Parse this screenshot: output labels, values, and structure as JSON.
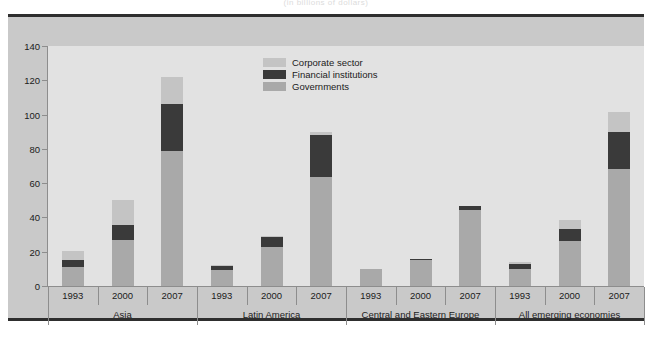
{
  "subtitle": "(in billions of dollars)",
  "legend": {
    "position": "top-center",
    "items": [
      {
        "key": "corp",
        "label": "Corporate sector",
        "color": "#c4c4c4"
      },
      {
        "key": "fin",
        "label": "Financial institutions",
        "color": "#3a3a3a"
      },
      {
        "key": "gov",
        "label": "Governments",
        "color": "#a9a9a9"
      }
    ]
  },
  "axis": {
    "ticks": [
      "0",
      "20",
      "40",
      "60",
      "80",
      "100",
      "120",
      "140"
    ]
  },
  "groups": [
    {
      "name": "Asia",
      "years": [
        "1993",
        "2000",
        "2007"
      ]
    },
    {
      "name": "Latin America",
      "years": [
        "1993",
        "2000",
        "2007"
      ]
    },
    {
      "name": "Central and Eastern Europe",
      "years": [
        "1993",
        "2000",
        "2007"
      ]
    },
    {
      "name": "All emerging economies",
      "years": [
        "1993",
        "2000",
        "2007"
      ]
    }
  ],
  "chart_data": {
    "type": "bar",
    "title": "",
    "subtitle": "(in billions of dollars)",
    "xlabel": "",
    "ylabel": "",
    "ylim": [
      0,
      140
    ],
    "ytick_step": 20,
    "grid": false,
    "stacked": true,
    "legend_position": "top-center",
    "categories": [
      "Asia 1993",
      "Asia 2000",
      "Asia 2007",
      "Latin America 1993",
      "Latin America 2000",
      "Latin America 2007",
      "Central and Eastern Europe 1993",
      "Central and Eastern Europe 2000",
      "Central and Eastern Europe 2007",
      "All emerging economies 1993",
      "All emerging economies 2000",
      "All emerging economies 2007"
    ],
    "series": [
      {
        "name": "Governments",
        "color": "#a9a9a9",
        "values": [
          11,
          27,
          78.5,
          9.5,
          23,
          63.5,
          10,
          15,
          44.5,
          10,
          26,
          68
        ]
      },
      {
        "name": "Financial institutions",
        "color": "#3a3a3a",
        "values": [
          4,
          8.5,
          27.5,
          2,
          5.5,
          24.5,
          0,
          1,
          2,
          3,
          7,
          22
        ]
      },
      {
        "name": "Corporate sector",
        "color": "#c4c4c4",
        "values": [
          5.5,
          14.5,
          16,
          0.5,
          0.5,
          2,
          0,
          0,
          0,
          1,
          5.5,
          11.5
        ]
      }
    ],
    "totals": [
      20.5,
      50,
      122,
      12,
      29,
      90,
      10,
      16,
      46.5,
      14,
      38.5,
      101.5
    ]
  }
}
